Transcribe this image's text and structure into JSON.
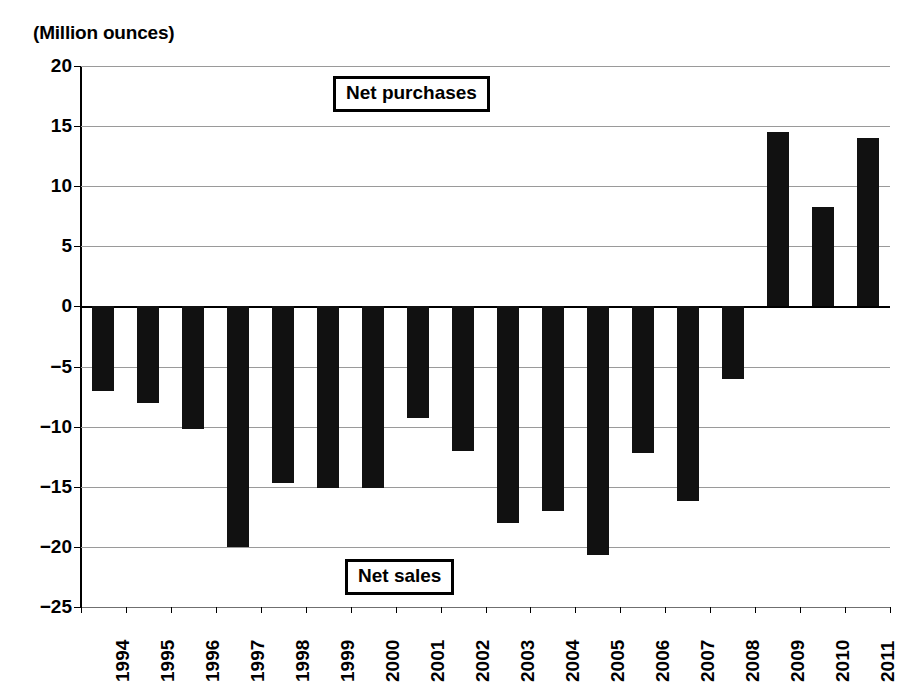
{
  "chart_data": {
    "type": "bar",
    "title": "",
    "unit_label": "(Million ounces)",
    "xlabel": "",
    "ylabel": "",
    "ylim": [
      -25,
      20
    ],
    "ytick_step": 5,
    "yticks": [
      20,
      15,
      10,
      5,
      0,
      -5,
      -10,
      -15,
      -20,
      -25
    ],
    "ytick_labels": [
      "20",
      "15",
      "10",
      "5",
      "0",
      "−5",
      "−10",
      "−15",
      "−20",
      "−25"
    ],
    "grid": true,
    "legend_position": "none",
    "bar_color": "#111111",
    "categories": [
      "1994",
      "1995",
      "1996",
      "1997",
      "1998",
      "1999",
      "2000",
      "2001",
      "2002",
      "2003",
      "2004",
      "2005",
      "2006",
      "2007",
      "2008",
      "2009",
      "2010",
      "2011"
    ],
    "values": [
      -7.0,
      -8.0,
      -10.2,
      -20.0,
      -14.7,
      -15.1,
      -15.1,
      -9.3,
      -12.0,
      -18.0,
      -17.0,
      -20.7,
      -12.2,
      -16.2,
      -6.0,
      14.5,
      8.3,
      14.0
    ],
    "annotations": [
      {
        "name": "net-purchases",
        "text": "Net purchases"
      },
      {
        "name": "net-sales",
        "text": "Net sales"
      }
    ]
  }
}
